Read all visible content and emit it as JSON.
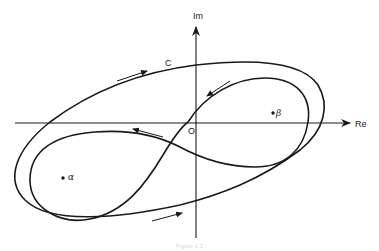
{
  "diagram": {
    "axes": {
      "real_label": "Re",
      "imag_label": "Im",
      "origin_label": "O"
    },
    "contour_label": "C",
    "points": [
      {
        "label": "α",
        "name": "alpha"
      },
      {
        "label": "β",
        "name": "beta"
      }
    ],
    "caption": "Figure 1.1",
    "colors": {
      "stroke": "#1a1a1a",
      "background": "#ffffff"
    }
  }
}
